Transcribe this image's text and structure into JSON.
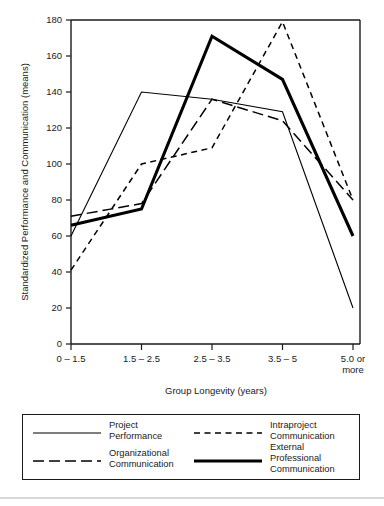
{
  "chart_data": {
    "type": "line",
    "title": "",
    "xlabel": "Group Longevity (years)",
    "ylabel": "Standardized Performance and Communication (means)",
    "categories": [
      "0 – 1.5",
      "1.5 – 2.5",
      "2.5 – 3.5",
      "3.5 – 5",
      "5.0 or\nmore"
    ],
    "x_tick_labels": [
      "0 – 1.5",
      "1.5 – 2.5",
      "2.5 – 3.5",
      "3.5 – 5",
      "5.0 or"
    ],
    "x_tick_label_second_line": "more",
    "y_tick_labels": [
      "0",
      "20",
      "40",
      "60",
      "80",
      "100",
      "120",
      "140",
      "160",
      "180"
    ],
    "y_ticks": [
      0,
      20,
      40,
      60,
      80,
      100,
      120,
      140,
      160,
      180
    ],
    "ylim": [
      0,
      180
    ],
    "grid": false,
    "legend_position": "below-plot",
    "series": [
      {
        "name": "Project Performance",
        "legend_label": "Project\nPerformance",
        "style": "thin-solid",
        "color": "#000000",
        "values": [
          60,
          140,
          136,
          129,
          20
        ]
      },
      {
        "name": "Intraproject Communication",
        "legend_label": "Intraproject\nCommunication",
        "style": "short-dash",
        "color": "#000000",
        "values": [
          41,
          100,
          109,
          179,
          80
        ]
      },
      {
        "name": "Organizational Communication",
        "legend_label": "Organizational\nCommunication",
        "style": "long-dash",
        "color": "#000000",
        "values": [
          71,
          78,
          136,
          124,
          80
        ]
      },
      {
        "name": "External Professional Communication",
        "legend_label": "External Professional\nCommunication",
        "style": "thick-solid",
        "color": "#000000",
        "values": [
          66,
          75,
          171,
          147,
          60
        ]
      }
    ]
  }
}
